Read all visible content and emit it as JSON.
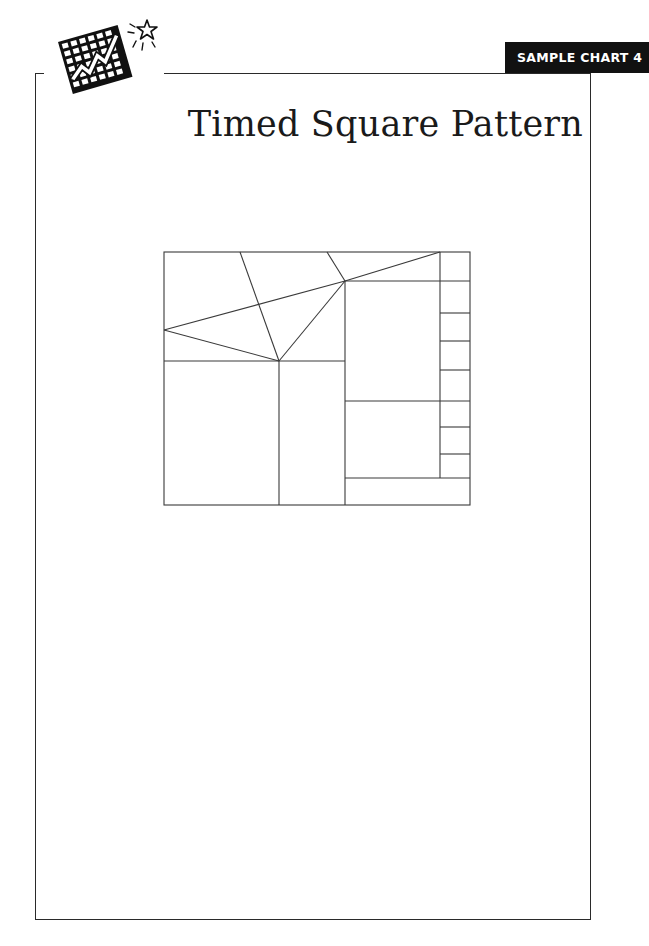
{
  "header": {
    "badge_label": "SAMPLE CHART 4",
    "title": "Timed Square Pattern",
    "logo_icon": "chart-grid-with-rising-arrow-and-star-icon"
  },
  "colors": {
    "badge_background": "#111111",
    "badge_text": "#ffffff",
    "line": "#333333",
    "background": "#ffffff"
  },
  "diagram": {
    "type": "geometric-grid-pattern",
    "outer_rect": {
      "x": 164,
      "y": 252,
      "width": 306,
      "height": 253
    },
    "right_column_row_lines_y": [
      281,
      313,
      341,
      370,
      401,
      427,
      454,
      478
    ],
    "right_column_x": 440,
    "regions": [
      "top-left triangular fan region",
      "large left-bottom square",
      "narrow middle-bottom column",
      "upper-middle tall rectangle",
      "lower-middle rectangle",
      "bottom strip",
      "right column of 9 small cells"
    ]
  }
}
